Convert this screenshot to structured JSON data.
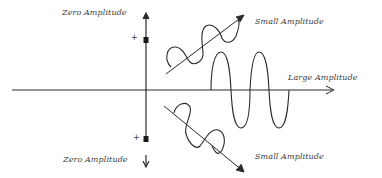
{
  "diagram": {
    "labels": {
      "zero_top": "Zero Amplitude",
      "zero_bottom": "Zero Amplitude",
      "small_top": "Small Amplitude",
      "small_bottom": "Small Amplitude",
      "large": "Large Amplitude"
    },
    "markers": {
      "plus_top": "+",
      "plus_bottom": "+"
    },
    "colors": {
      "stroke": "#2a2a2a",
      "text": "#3a3a3a",
      "background": "#ffffff"
    },
    "axes": {
      "horizontal": {
        "y": 90,
        "x_start": 12,
        "x_end": 335
      },
      "vertical": {
        "x": 146,
        "y_start": 13,
        "y_end": 140
      }
    }
  }
}
